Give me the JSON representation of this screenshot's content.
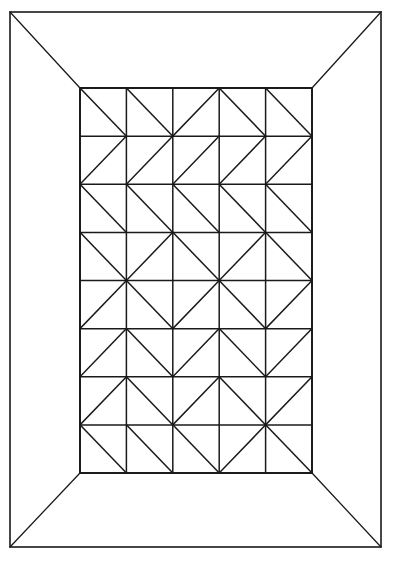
{
  "figure": {
    "background_color": "#ffffff",
    "line_color": "#1a1a1a",
    "width": 399,
    "height": 565
  },
  "outer_frame": {
    "name": "outer-rectangle",
    "x": 10,
    "y": 12,
    "width": 371,
    "height": 535
  },
  "inner_panel": {
    "name": "inner-rectangle",
    "x": 80,
    "y": 88,
    "width": 232,
    "height": 385,
    "columns": 5,
    "rows": 8,
    "cell_width": 46.4,
    "cell_height": 48.125
  },
  "perspective_connectors": [
    {
      "name": "corner-line-top-left",
      "x1": 10,
      "y1": 12,
      "x2": 80,
      "y2": 88
    },
    {
      "name": "corner-line-top-right",
      "x1": 381,
      "y1": 12,
      "x2": 312,
      "y2": 88
    },
    {
      "name": "corner-line-bottom-left",
      "x1": 10,
      "y1": 547,
      "x2": 80,
      "y2": 473
    },
    {
      "name": "corner-line-bottom-right",
      "x1": 381,
      "y1": 547,
      "x2": 312,
      "y2": 473
    }
  ],
  "grid_vertical_x": [
    80,
    126.4,
    172.8,
    219.2,
    265.6,
    312
  ],
  "grid_horizontal_y": [
    88,
    136.125,
    184.25,
    232.375,
    280.5,
    328.625,
    376.75,
    424.875,
    473
  ],
  "diagonals": {
    "legend": {
      "backslash": "top-left to bottom-right",
      "slash": "bottom-left to top-right"
    },
    "rows": [
      [
        "\\",
        "\\",
        "/",
        "\\",
        "\\"
      ],
      [
        "/",
        "/",
        "/",
        "/",
        "/"
      ],
      [
        "\\",
        "\\",
        "\\",
        "\\",
        "\\"
      ],
      [
        "\\",
        "/",
        "\\",
        "/",
        "\\"
      ],
      [
        "/",
        "\\",
        "/",
        "\\",
        "/"
      ],
      [
        "/",
        "\\",
        "/",
        "\\",
        "/"
      ],
      [
        "/",
        "\\",
        "/",
        "\\",
        "/"
      ],
      [
        "\\",
        "\\",
        "\\",
        "/",
        "\\"
      ]
    ]
  }
}
